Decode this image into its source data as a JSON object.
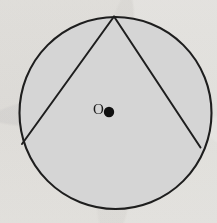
{
  "figure": {
    "background_color": "#f3f2f0",
    "canvas": {
      "width": 217,
      "height": 223
    },
    "circle": {
      "name": "circle",
      "center_x": 115.5,
      "center_y": 113,
      "radius": 96,
      "fill_color": "#d5d5d5",
      "stroke_color": "#1e1e1e",
      "stroke_width": 2.1
    },
    "center_point": {
      "name": "center-point",
      "x": 109,
      "y": 112,
      "radius": 5.2,
      "fill_color": "#101010",
      "label": "O",
      "label_x": 98.5,
      "label_y": 111,
      "label_color": "#1b1b1b",
      "label_font_size": 15
    },
    "chords": [
      {
        "name": "left-chord",
        "from_x": 114,
        "from_y": 16.5,
        "to_x": 22,
        "to_y": 144,
        "stroke_color": "#1e1e1e",
        "stroke_width": 2.0
      },
      {
        "name": "right-chord",
        "from_x": 114,
        "from_y": 16.5,
        "to_x": 200.5,
        "to_y": 147.5,
        "stroke_color": "#1e1e1e",
        "stroke_width": 2.0
      }
    ],
    "apex": {
      "name": "apex-vertex",
      "x": 114,
      "y": 16.5
    }
  }
}
